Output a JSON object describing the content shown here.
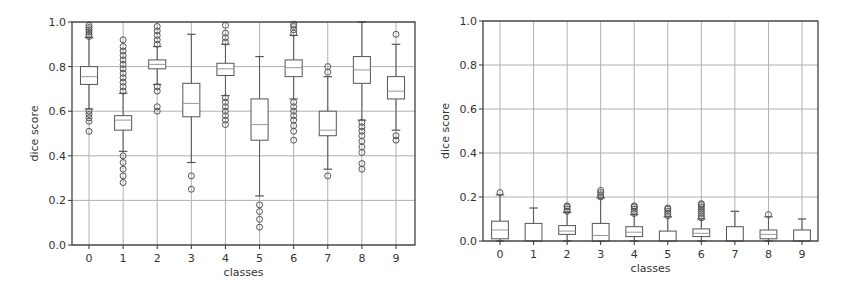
{
  "chart_data": [
    {
      "type": "box",
      "title": "",
      "xlabel": "classes",
      "ylabel": "dice score",
      "ylim": [
        0.0,
        1.0
      ],
      "yticks": [
        "0.0",
        "0.2",
        "0.4",
        "0.6",
        "0.8",
        "1.0"
      ],
      "categories": [
        "0",
        "1",
        "2",
        "3",
        "4",
        "5",
        "6",
        "7",
        "8",
        "9"
      ],
      "grid": true,
      "legend": null,
      "boxes": [
        {
          "category": "0",
          "whisker_low": 0.61,
          "q1": 0.72,
          "median": 0.755,
          "q3": 0.8,
          "whisker_high": 0.93,
          "outliers": [
            0.51,
            0.555,
            0.57,
            0.585,
            0.6,
            0.935,
            0.945,
            0.955,
            0.965,
            0.975,
            0.985
          ]
        },
        {
          "category": "1",
          "whisker_low": 0.42,
          "q1": 0.515,
          "median": 0.56,
          "q3": 0.58,
          "whisker_high": 0.68,
          "outliers": [
            0.28,
            0.31,
            0.34,
            0.37,
            0.4,
            0.69,
            0.71,
            0.73,
            0.75,
            0.77,
            0.79,
            0.81,
            0.83,
            0.85,
            0.87,
            0.89,
            0.92
          ]
        },
        {
          "category": "2",
          "whisker_low": 0.72,
          "q1": 0.79,
          "median": 0.81,
          "q3": 0.83,
          "whisker_high": 0.89,
          "outliers": [
            0.6,
            0.62,
            0.69,
            0.71,
            0.9,
            0.92,
            0.94,
            0.96,
            0.98
          ]
        },
        {
          "category": "3",
          "whisker_low": 0.37,
          "q1": 0.575,
          "median": 0.635,
          "q3": 0.725,
          "whisker_high": 0.945,
          "outliers": [
            0.25,
            0.31
          ]
        },
        {
          "category": "4",
          "whisker_low": 0.67,
          "q1": 0.76,
          "median": 0.79,
          "q3": 0.815,
          "whisker_high": 0.9,
          "outliers": [
            0.54,
            0.56,
            0.58,
            0.6,
            0.62,
            0.64,
            0.66,
            0.91,
            0.93,
            0.95,
            0.985
          ]
        },
        {
          "category": "5",
          "whisker_low": 0.22,
          "q1": 0.47,
          "median": 0.54,
          "q3": 0.655,
          "whisker_high": 0.845,
          "outliers": [
            0.08,
            0.115,
            0.15,
            0.18
          ]
        },
        {
          "category": "6",
          "whisker_low": 0.655,
          "q1": 0.755,
          "median": 0.795,
          "q3": 0.83,
          "whisker_high": 0.94,
          "outliers": [
            0.47,
            0.51,
            0.535,
            0.56,
            0.58,
            0.6,
            0.62,
            0.64,
            0.95,
            0.965,
            0.98,
            0.99
          ]
        },
        {
          "category": "7",
          "whisker_low": 0.34,
          "q1": 0.49,
          "median": 0.515,
          "q3": 0.6,
          "whisker_high": 0.755,
          "outliers": [
            0.31,
            0.775,
            0.8
          ]
        },
        {
          "category": "8",
          "whisker_low": 0.56,
          "q1": 0.725,
          "median": 0.785,
          "q3": 0.845,
          "whisker_high": 1.0,
          "outliers": [
            0.34,
            0.365,
            0.415,
            0.44,
            0.465,
            0.49,
            0.51,
            0.53,
            0.55
          ]
        },
        {
          "category": "9",
          "whisker_low": 0.515,
          "q1": 0.655,
          "median": 0.69,
          "q3": 0.755,
          "whisker_high": 0.9,
          "outliers": [
            0.47,
            0.49,
            0.945
          ]
        }
      ]
    },
    {
      "type": "box",
      "title": "",
      "xlabel": "classes",
      "ylabel": "dice score",
      "ylim": [
        0.0,
        1.0
      ],
      "yticks": [
        "0.0",
        "0.2",
        "0.4",
        "0.6",
        "0.8",
        "1.0"
      ],
      "categories": [
        "0",
        "1",
        "2",
        "3",
        "4",
        "5",
        "6",
        "7",
        "8",
        "9"
      ],
      "grid": true,
      "legend": null,
      "boxes": [
        {
          "category": "0",
          "whisker_low": 0.0,
          "q1": 0.01,
          "median": 0.05,
          "q3": 0.09,
          "whisker_high": 0.21,
          "outliers": [
            0.22
          ]
        },
        {
          "category": "1",
          "whisker_low": 0.0,
          "q1": 0.0,
          "median": 0.0,
          "q3": 0.08,
          "whisker_high": 0.15,
          "outliers": []
        },
        {
          "category": "2",
          "whisker_low": 0.0,
          "q1": 0.03,
          "median": 0.045,
          "q3": 0.07,
          "whisker_high": 0.13,
          "outliers": [
            0.135,
            0.145,
            0.155,
            0.16
          ]
        },
        {
          "category": "3",
          "whisker_low": 0.0,
          "q1": 0.0,
          "median": 0.025,
          "q3": 0.08,
          "whisker_high": 0.195,
          "outliers": [
            0.2,
            0.21,
            0.22,
            0.23
          ]
        },
        {
          "category": "4",
          "whisker_low": 0.0,
          "q1": 0.02,
          "median": 0.04,
          "q3": 0.065,
          "whisker_high": 0.12,
          "outliers": [
            0.125,
            0.135,
            0.145,
            0.155,
            0.16
          ]
        },
        {
          "category": "5",
          "whisker_low": 0.0,
          "q1": 0.0,
          "median": 0.0,
          "q3": 0.045,
          "whisker_high": 0.11,
          "outliers": [
            0.115,
            0.125,
            0.135,
            0.145,
            0.15
          ]
        },
        {
          "category": "6",
          "whisker_low": 0.0,
          "q1": 0.02,
          "median": 0.035,
          "q3": 0.055,
          "whisker_high": 0.1,
          "outliers": [
            0.105,
            0.115,
            0.125,
            0.135,
            0.145,
            0.155,
            0.165,
            0.17
          ]
        },
        {
          "category": "7",
          "whisker_low": 0.0,
          "q1": 0.0,
          "median": 0.0,
          "q3": 0.065,
          "whisker_high": 0.135,
          "outliers": []
        },
        {
          "category": "8",
          "whisker_low": 0.0,
          "q1": 0.01,
          "median": 0.03,
          "q3": 0.05,
          "whisker_high": 0.11,
          "outliers": [
            0.12
          ]
        },
        {
          "category": "9",
          "whisker_low": 0.0,
          "q1": 0.0,
          "median": 0.0,
          "q3": 0.05,
          "whisker_high": 0.1,
          "outliers": []
        }
      ]
    }
  ],
  "style": {
    "axis_color": "#333333",
    "grid_color": "#b0b0b0",
    "box_color": "#555555",
    "median_color": "#999999",
    "background": "#ffffff"
  }
}
